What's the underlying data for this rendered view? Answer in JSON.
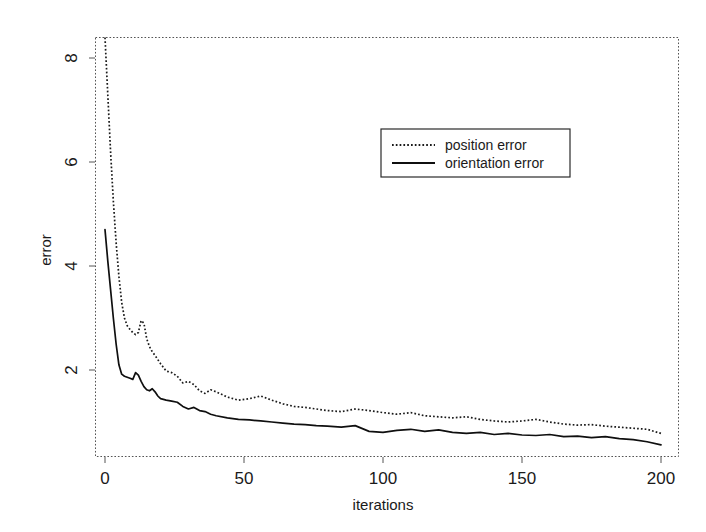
{
  "chart_data": {
    "type": "line",
    "title": "",
    "xlabel": "iterations",
    "ylabel": "error",
    "xlim": [
      -3,
      203
    ],
    "ylim": [
      0.0,
      8.95
    ],
    "grid": false,
    "legend_position": "upper-center-right",
    "xticks": [
      0,
      50,
      100,
      150,
      200
    ],
    "xtick_labels": [
      "0",
      "50",
      "100",
      "150",
      "200"
    ],
    "yticks": [
      2,
      4,
      6,
      8
    ],
    "ytick_labels": [
      "2",
      "4",
      "6",
      "8"
    ],
    "x": [
      0,
      1,
      2,
      3,
      4,
      5,
      6,
      7,
      8,
      9,
      10,
      11,
      12,
      13,
      14,
      15,
      16,
      17,
      18,
      19,
      20,
      22,
      24,
      26,
      28,
      30,
      32,
      34,
      36,
      38,
      40,
      44,
      48,
      52,
      56,
      60,
      64,
      68,
      72,
      76,
      80,
      85,
      90,
      95,
      100,
      105,
      110,
      115,
      120,
      125,
      130,
      135,
      140,
      145,
      150,
      155,
      160,
      165,
      170,
      175,
      180,
      185,
      190,
      195,
      200
    ],
    "series": [
      {
        "name": "position error",
        "style": "dotted",
        "values": [
          8.55,
          7.3,
          6.2,
          5.25,
          4.45,
          3.8,
          3.3,
          3.0,
          2.85,
          2.78,
          2.72,
          2.68,
          2.72,
          2.95,
          2.9,
          2.6,
          2.45,
          2.35,
          2.28,
          2.2,
          2.12,
          1.98,
          1.95,
          1.88,
          1.75,
          1.78,
          1.72,
          1.6,
          1.55,
          1.62,
          1.58,
          1.48,
          1.42,
          1.45,
          1.5,
          1.42,
          1.35,
          1.3,
          1.28,
          1.25,
          1.22,
          1.2,
          1.25,
          1.22,
          1.18,
          1.15,
          1.18,
          1.12,
          1.1,
          1.08,
          1.1,
          1.05,
          1.02,
          1.0,
          1.02,
          1.05,
          1.0,
          0.96,
          0.94,
          0.95,
          0.92,
          0.9,
          0.88,
          0.86,
          0.78
        ]
      },
      {
        "name": "orientation error",
        "style": "solid",
        "values": [
          4.7,
          4.1,
          3.55,
          3.0,
          2.5,
          2.1,
          1.92,
          1.88,
          1.86,
          1.84,
          1.82,
          1.95,
          1.9,
          1.78,
          1.68,
          1.62,
          1.6,
          1.64,
          1.58,
          1.5,
          1.45,
          1.42,
          1.4,
          1.38,
          1.3,
          1.25,
          1.28,
          1.22,
          1.2,
          1.15,
          1.12,
          1.08,
          1.05,
          1.04,
          1.02,
          1.0,
          0.98,
          0.96,
          0.95,
          0.93,
          0.92,
          0.9,
          0.93,
          0.82,
          0.8,
          0.84,
          0.86,
          0.82,
          0.85,
          0.8,
          0.78,
          0.8,
          0.76,
          0.78,
          0.75,
          0.74,
          0.76,
          0.72,
          0.73,
          0.7,
          0.72,
          0.68,
          0.66,
          0.62,
          0.56
        ]
      }
    ]
  },
  "legend": {
    "entries": [
      {
        "label": "position error",
        "style": "dotted"
      },
      {
        "label": "orientation error",
        "style": "solid"
      }
    ]
  },
  "axes": {
    "x_title": "iterations",
    "y_title": "error"
  }
}
